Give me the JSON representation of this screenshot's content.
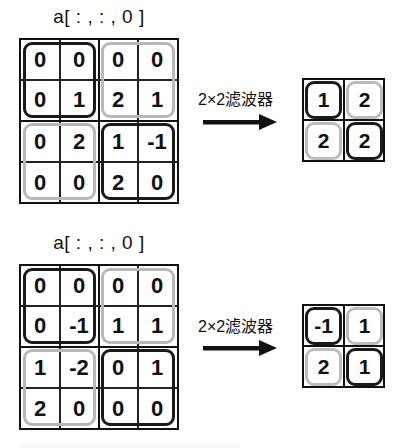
{
  "panels": [
    {
      "title": "a[ : , : , 0 ]",
      "input": [
        [
          "0",
          "0",
          "0",
          "0"
        ],
        [
          "0",
          "1",
          "2",
          "1"
        ],
        [
          "0",
          "2",
          "1",
          "-1"
        ],
        [
          "0",
          "0",
          "2",
          "0"
        ]
      ],
      "filter_label": "2×2滤波器",
      "output": [
        [
          "1",
          "2"
        ],
        [
          "2",
          "2"
        ]
      ]
    },
    {
      "title": "a[ : , : , 0 ]",
      "input": [
        [
          "0",
          "0",
          "0",
          "0"
        ],
        [
          "0",
          "-1",
          "1",
          "1"
        ],
        [
          "1",
          "-2",
          "0",
          "1"
        ],
        [
          "2",
          "0",
          "0",
          "0"
        ]
      ],
      "filter_label": "2×2滤波器",
      "output": [
        [
          "-1",
          "1"
        ],
        [
          "2",
          "1"
        ]
      ]
    }
  ],
  "region_styles": {
    "dark": "#1a1a1a",
    "light": "#b8b8b8"
  }
}
